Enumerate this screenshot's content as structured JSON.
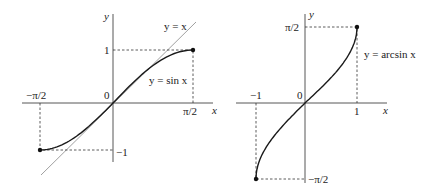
{
  "colors": {
    "curve": "#1a1a1a",
    "axis": "#444444",
    "dashed": "#333333",
    "identity_line": "#777777",
    "background": "#ffffff"
  },
  "left_graph": {
    "y_axis_label": "y",
    "x_axis_label": "x",
    "origin_label": "0",
    "x_tick_neg": "−π/2",
    "x_tick_pos": "π/2",
    "y_tick_pos": "1",
    "y_tick_neg": "−1",
    "curve_label": "y = sin x",
    "identity_label": "y = x"
  },
  "right_graph": {
    "y_axis_label": "y",
    "x_axis_label": "x",
    "origin_label": "0",
    "x_tick_neg": "−1",
    "x_tick_pos": "1",
    "y_tick_pos": "π/2",
    "y_tick_neg": "−π/2",
    "curve_label": "y = arcsin x"
  },
  "chart_data": [
    {
      "type": "line",
      "title": "y = sin x on [-π/2, π/2]",
      "xlabel": "x",
      "ylabel": "y",
      "series": [
        {
          "name": "y = sin x",
          "x": [
            -1.5708,
            -1.2,
            -0.8,
            -0.4,
            0,
            0.4,
            0.8,
            1.2,
            1.5708
          ],
          "values": [
            -1,
            -0.932,
            -0.717,
            -0.389,
            0,
            0.389,
            0.717,
            0.932,
            1
          ]
        },
        {
          "name": "y = x",
          "x": [
            -1.4,
            1.6
          ],
          "values": [
            -1.4,
            1.6
          ]
        }
      ],
      "x_ticks": [
        "−π/2",
        "π/2"
      ],
      "y_ticks": [
        "−1",
        "1"
      ],
      "endpoints": [
        [
          -1.5708,
          -1
        ],
        [
          1.5708,
          1
        ]
      ],
      "grid": false
    },
    {
      "type": "line",
      "title": "y = arcsin x on [-1, 1]",
      "xlabel": "x",
      "ylabel": "y",
      "series": [
        {
          "name": "y = arcsin x",
          "x": [
            -1,
            -0.9,
            -0.6,
            -0.3,
            0,
            0.3,
            0.6,
            0.9,
            1
          ],
          "values": [
            -1.5708,
            -1.1198,
            -0.6435,
            -0.3047,
            0,
            0.3047,
            0.6435,
            1.1198,
            1.5708
          ]
        }
      ],
      "x_ticks": [
        "−1",
        "1"
      ],
      "y_ticks": [
        "−π/2",
        "π/2"
      ],
      "endpoints": [
        [
          -1,
          -1.5708
        ],
        [
          1,
          1.5708
        ]
      ],
      "grid": false
    }
  ]
}
